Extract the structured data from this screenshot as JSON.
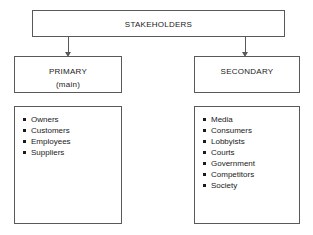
{
  "diagram": {
    "root": {
      "label": "STAKEHOLDERS"
    },
    "branches": [
      {
        "id": "primary",
        "label": "PRIMARY",
        "sublabel": "(main)",
        "items": [
          "Owners",
          "Customers",
          "Employees",
          "Suppliers"
        ]
      },
      {
        "id": "secondary",
        "label": "SECONDARY",
        "sublabel": "",
        "items": [
          "Media",
          "Consumers",
          "Lobbyists",
          "Courts",
          "Government",
          "Competitors",
          "Society"
        ]
      }
    ],
    "connectors": [
      {
        "from": "root",
        "to": "primary",
        "icon": "arrow-down-icon"
      },
      {
        "from": "root",
        "to": "secondary",
        "icon": "arrow-down-icon"
      }
    ],
    "colors": {
      "border": "#595959",
      "text": "#1a1a1a",
      "background": "#ffffff"
    }
  }
}
